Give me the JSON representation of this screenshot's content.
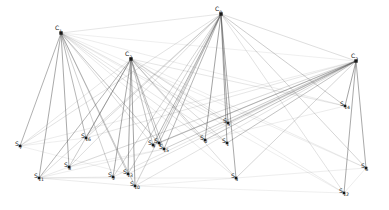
{
  "figure": {
    "title": "",
    "width": 389,
    "height": 210,
    "background_color": "#ffffff"
  },
  "chart_data": {
    "type": "scatter",
    "title": "",
    "xlabel": "",
    "ylabel": "",
    "grid": false,
    "legend_position": "none",
    "xlim": [
      0,
      389
    ],
    "ylim": [
      0,
      210
    ],
    "node_groups": [
      {
        "name": "cluster-nodes",
        "prefix": "C",
        "marker": "square",
        "color": "#1a1a1a",
        "size": 3.4,
        "count": 4
      },
      {
        "name": "site-nodes",
        "prefix": "S",
        "marker": "square",
        "color": "#1a1a1a",
        "size": 2.6,
        "count": 17
      }
    ],
    "nodes": [
      {
        "id": "C1",
        "label": "C",
        "sub": "1",
        "x": 61,
        "y": 33,
        "group": "cluster-nodes",
        "label_dx": -6,
        "label_dy": -3
      },
      {
        "id": "C3",
        "label": "C",
        "sub": "3",
        "x": 131,
        "y": 59,
        "group": "cluster-nodes",
        "label_dx": -6,
        "label_dy": -3
      },
      {
        "id": "C0",
        "label": "C",
        "sub": "0",
        "x": 221,
        "y": 14,
        "group": "cluster-nodes",
        "label_dx": -6,
        "label_dy": -3
      },
      {
        "id": "C2",
        "label": "C",
        "sub": "2",
        "x": 356,
        "y": 61,
        "group": "cluster-nodes",
        "label_dx": -5,
        "label_dy": -3
      },
      {
        "id": "S7",
        "label": "S",
        "sub": "7",
        "x": 20,
        "y": 146,
        "group": "site-nodes",
        "label_dx": -5,
        "label_dy": 0
      },
      {
        "id": "S16",
        "label": "S",
        "sub": "16",
        "x": 86,
        "y": 138,
        "group": "site-nodes",
        "label_dx": -5,
        "label_dy": 0
      },
      {
        "id": "S8",
        "label": "S",
        "sub": "8",
        "x": 69,
        "y": 167,
        "group": "site-nodes",
        "label_dx": -5,
        "label_dy": 0
      },
      {
        "id": "S11",
        "label": "S",
        "sub": "11",
        "x": 39,
        "y": 178,
        "group": "site-nodes",
        "label_dx": -5,
        "label_dy": 0
      },
      {
        "id": "S2",
        "label": "S",
        "sub": "2",
        "x": 113,
        "y": 177,
        "group": "site-nodes",
        "label_dx": -5,
        "label_dy": 0
      },
      {
        "id": "S13",
        "label": "S",
        "sub": "13",
        "x": 128,
        "y": 174,
        "group": "site-nodes",
        "label_dx": -5,
        "label_dy": 0
      },
      {
        "id": "S10",
        "label": "S",
        "sub": "10",
        "x": 135,
        "y": 186,
        "group": "site-nodes",
        "label_dx": -5,
        "label_dy": 0
      },
      {
        "id": "S9",
        "label": "S",
        "sub": "9",
        "x": 153,
        "y": 145,
        "group": "site-nodes",
        "label_dx": -5,
        "label_dy": 0
      },
      {
        "id": "S15",
        "label": "S",
        "sub": "15",
        "x": 164,
        "y": 149,
        "group": "site-nodes",
        "label_dx": -5,
        "label_dy": 0
      },
      {
        "id": "S5",
        "label": "S",
        "sub": "5",
        "x": 228,
        "y": 123,
        "group": "site-nodes",
        "label_dx": -5,
        "label_dy": 0
      },
      {
        "id": "S0",
        "label": "S",
        "sub": "0",
        "x": 205,
        "y": 140,
        "group": "site-nodes",
        "label_dx": -5,
        "label_dy": 0
      },
      {
        "id": "S1",
        "label": "S",
        "sub": "1",
        "x": 227,
        "y": 143,
        "group": "site-nodes",
        "label_dx": -5,
        "label_dy": 0
      },
      {
        "id": "S4",
        "label": "S",
        "sub": "4",
        "x": 236,
        "y": 178,
        "group": "site-nodes",
        "label_dx": -5,
        "label_dy": 0
      },
      {
        "id": "S14",
        "label": "S",
        "sub": "14",
        "x": 345,
        "y": 106,
        "group": "site-nodes",
        "label_dx": -5,
        "label_dy": 0
      },
      {
        "id": "S6",
        "label": "S",
        "sub": "6",
        "x": 366,
        "y": 168,
        "group": "site-nodes",
        "label_dx": -5,
        "label_dy": 0
      },
      {
        "id": "S12",
        "label": "S",
        "sub": "12",
        "x": 344,
        "y": 193,
        "group": "site-nodes",
        "label_dx": -5,
        "label_dy": 0
      },
      {
        "id": "S3",
        "label": "S",
        "sub": "3",
        "x": 159,
        "y": 143,
        "group": "site-nodes",
        "label_dx": -5,
        "label_dy": 0
      }
    ],
    "edges": [
      {
        "from": "C1",
        "to": "S7",
        "weight": 0.85
      },
      {
        "from": "C1",
        "to": "S11",
        "weight": 0.9
      },
      {
        "from": "C1",
        "to": "S8",
        "weight": 0.9
      },
      {
        "from": "C1",
        "to": "S16",
        "weight": 0.8
      },
      {
        "from": "C1",
        "to": "S2",
        "weight": 0.55
      },
      {
        "from": "C1",
        "to": "S13",
        "weight": 0.6
      },
      {
        "from": "C1",
        "to": "S10",
        "weight": 0.6
      },
      {
        "from": "C1",
        "to": "S9",
        "weight": 0.4
      },
      {
        "from": "C1",
        "to": "S15",
        "weight": 0.4
      },
      {
        "from": "C1",
        "to": "S0",
        "weight": 0.35
      },
      {
        "from": "C1",
        "to": "S1",
        "weight": 0.3
      },
      {
        "from": "C1",
        "to": "S5",
        "weight": 0.3
      },
      {
        "from": "C1",
        "to": "S4",
        "weight": 0.25
      },
      {
        "from": "C1",
        "to": "S3",
        "weight": 0.35
      },
      {
        "from": "C1",
        "to": "S14",
        "weight": 0.2
      },
      {
        "from": "C1",
        "to": "S6",
        "weight": 0.18
      },
      {
        "from": "C1",
        "to": "S12",
        "weight": 0.18
      },
      {
        "from": "C1",
        "to": "C2",
        "weight": 0.15
      },
      {
        "from": "C3",
        "to": "S16",
        "weight": 0.85
      },
      {
        "from": "C3",
        "to": "S2",
        "weight": 0.9
      },
      {
        "from": "C3",
        "to": "S13",
        "weight": 0.95
      },
      {
        "from": "C3",
        "to": "S10",
        "weight": 0.95
      },
      {
        "from": "C3",
        "to": "S11",
        "weight": 0.8
      },
      {
        "from": "C3",
        "to": "S8",
        "weight": 0.6
      },
      {
        "from": "C3",
        "to": "S9",
        "weight": 0.7
      },
      {
        "from": "C3",
        "to": "S15",
        "weight": 0.7
      },
      {
        "from": "C3",
        "to": "S3",
        "weight": 0.65
      },
      {
        "from": "C3",
        "to": "S0",
        "weight": 0.55
      },
      {
        "from": "C3",
        "to": "S1",
        "weight": 0.45
      },
      {
        "from": "C3",
        "to": "S5",
        "weight": 0.45
      },
      {
        "from": "C3",
        "to": "S4",
        "weight": 0.4
      },
      {
        "from": "C3",
        "to": "S7",
        "weight": 0.3
      },
      {
        "from": "C3",
        "to": "S14",
        "weight": 0.3
      },
      {
        "from": "C3",
        "to": "S6",
        "weight": 0.2
      },
      {
        "from": "C3",
        "to": "S12",
        "weight": 0.2
      },
      {
        "from": "C0",
        "to": "S0",
        "weight": 0.95
      },
      {
        "from": "C0",
        "to": "S1",
        "weight": 0.95
      },
      {
        "from": "C0",
        "to": "S5",
        "weight": 0.95
      },
      {
        "from": "C0",
        "to": "S4",
        "weight": 0.9
      },
      {
        "from": "C0",
        "to": "S15",
        "weight": 0.8
      },
      {
        "from": "C0",
        "to": "S9",
        "weight": 0.8
      },
      {
        "from": "C0",
        "to": "S3",
        "weight": 0.75
      },
      {
        "from": "C0",
        "to": "S13",
        "weight": 0.55
      },
      {
        "from": "C0",
        "to": "S10",
        "weight": 0.55
      },
      {
        "from": "C0",
        "to": "S2",
        "weight": 0.5
      },
      {
        "from": "C0",
        "to": "S16",
        "weight": 0.45
      },
      {
        "from": "C0",
        "to": "S8",
        "weight": 0.4
      },
      {
        "from": "C0",
        "to": "S11",
        "weight": 0.4
      },
      {
        "from": "C0",
        "to": "S7",
        "weight": 0.35
      },
      {
        "from": "C0",
        "to": "S14",
        "weight": 0.6
      },
      {
        "from": "C0",
        "to": "S6",
        "weight": 0.5
      },
      {
        "from": "C0",
        "to": "S12",
        "weight": 0.35
      },
      {
        "from": "C0",
        "to": "C2",
        "weight": 0.4
      },
      {
        "from": "C0",
        "to": "C1",
        "weight": 0.3
      },
      {
        "from": "C2",
        "to": "S14",
        "weight": 0.95
      },
      {
        "from": "C2",
        "to": "S6",
        "weight": 0.9
      },
      {
        "from": "C2",
        "to": "S12",
        "weight": 0.9
      },
      {
        "from": "C2",
        "to": "S5",
        "weight": 0.7
      },
      {
        "from": "C2",
        "to": "S1",
        "weight": 0.7
      },
      {
        "from": "C2",
        "to": "S0",
        "weight": 0.7
      },
      {
        "from": "C2",
        "to": "S15",
        "weight": 0.6
      },
      {
        "from": "C2",
        "to": "S9",
        "weight": 0.6
      },
      {
        "from": "C2",
        "to": "S3",
        "weight": 0.55
      },
      {
        "from": "C2",
        "to": "S4",
        "weight": 0.5
      },
      {
        "from": "C2",
        "to": "S13",
        "weight": 0.35
      },
      {
        "from": "C2",
        "to": "S10",
        "weight": 0.35
      },
      {
        "from": "C2",
        "to": "S2",
        "weight": 0.3
      },
      {
        "from": "C2",
        "to": "S16",
        "weight": 0.3
      },
      {
        "from": "C2",
        "to": "S11",
        "weight": 0.25
      },
      {
        "from": "C2",
        "to": "S8",
        "weight": 0.22
      },
      {
        "from": "C2",
        "to": "S7",
        "weight": 0.2
      },
      {
        "from": "S11",
        "to": "S2",
        "weight": 0.22
      },
      {
        "from": "S11",
        "to": "S10",
        "weight": 0.22
      },
      {
        "from": "S11",
        "to": "S15",
        "weight": 0.2
      },
      {
        "from": "S11",
        "to": "S4",
        "weight": 0.18
      },
      {
        "from": "S7",
        "to": "S16",
        "weight": 0.18
      },
      {
        "from": "S7",
        "to": "S13",
        "weight": 0.16
      },
      {
        "from": "S10",
        "to": "S4",
        "weight": 0.16
      },
      {
        "from": "S10",
        "to": "S12",
        "weight": 0.15
      },
      {
        "from": "S4",
        "to": "S6",
        "weight": 0.18
      },
      {
        "from": "S12",
        "to": "S6",
        "weight": 0.2
      },
      {
        "from": "S0",
        "to": "S14",
        "weight": 0.2
      },
      {
        "from": "S8",
        "to": "S15",
        "weight": 0.15
      }
    ]
  },
  "style": {
    "edge_color": "#555555",
    "node_color": "#1a1a1a",
    "label_color": "#111111"
  }
}
